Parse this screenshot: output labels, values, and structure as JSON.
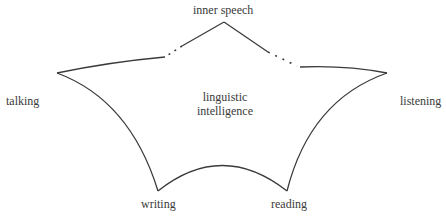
{
  "diagram": {
    "center": {
      "line1": "linguistic",
      "line2": "intelligence"
    },
    "vertices": {
      "top": "inner speech",
      "left": "talking",
      "right": "listening",
      "bottom_left": "writing",
      "bottom_right": "reading"
    },
    "stroke_color": "#3a3a3a"
  }
}
